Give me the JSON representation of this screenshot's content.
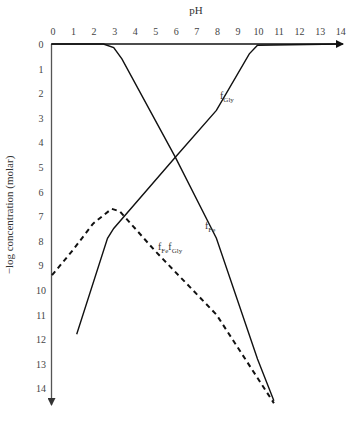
{
  "chart_data": {
    "type": "line",
    "title": "",
    "xlabel": "pH",
    "ylabel": "−log concentration (molar)",
    "xlim": [
      0,
      14
    ],
    "ylim": [
      0,
      14
    ],
    "y_inverted": true,
    "x_axis_position": "top",
    "grid": false,
    "x_ticks": [
      0,
      1,
      2,
      3,
      4,
      5,
      6,
      7,
      8,
      9,
      10,
      11,
      12,
      13,
      14
    ],
    "y_ticks": [
      0,
      1,
      2,
      3,
      4,
      5,
      6,
      7,
      8,
      9,
      10,
      11,
      12,
      13,
      14
    ],
    "series": [
      {
        "name": "f_Fe",
        "label_main": "f",
        "label_sub": "Fe",
        "style": "solid",
        "points": [
          [
            0,
            0
          ],
          [
            2.5,
            0
          ],
          [
            3.0,
            0.15
          ],
          [
            3.4,
            0.6
          ],
          [
            6,
            4.6
          ],
          [
            8,
            7.9
          ],
          [
            10,
            12.8
          ],
          [
            10.8,
            14.5
          ]
        ]
      },
      {
        "name": "f_Gly",
        "label_main": "f",
        "label_sub": "Gly",
        "style": "solid",
        "points": [
          [
            1.2,
            11.8
          ],
          [
            2.7,
            7.9
          ],
          [
            3.0,
            7.5
          ],
          [
            6,
            4.6
          ],
          [
            8,
            2.7
          ],
          [
            9.6,
            0.4
          ],
          [
            10.0,
            0.05
          ],
          [
            14,
            0
          ]
        ]
      },
      {
        "name": "f_Fe f_Gly",
        "label_main": "f",
        "label_sub": "Fe",
        "label_main2": "f",
        "label_sub2": "Gly",
        "style": "dashed",
        "points": [
          [
            0,
            9.4
          ],
          [
            1,
            8.4
          ],
          [
            2,
            7.3
          ],
          [
            2.9,
            6.7
          ],
          [
            3.3,
            6.8
          ],
          [
            5,
            8.4
          ],
          [
            8,
            11.0
          ],
          [
            10.8,
            14.6
          ]
        ]
      }
    ]
  },
  "labels": {
    "x_axis_title": "pH",
    "y_axis_title": "−log concentration (molar)",
    "x_tick_labels": [
      "0",
      "1",
      "2",
      "3",
      "4",
      "5",
      "6",
      "7",
      "8",
      "9",
      "10",
      "11",
      "12",
      "13",
      "14"
    ],
    "y_tick_labels": [
      "0",
      "1",
      "2",
      "3",
      "4",
      "5",
      "6",
      "7",
      "8",
      "9",
      "10",
      "11",
      "12",
      "13",
      "14"
    ],
    "f": "f",
    "fe": "Fe",
    "gly": "Gly"
  }
}
